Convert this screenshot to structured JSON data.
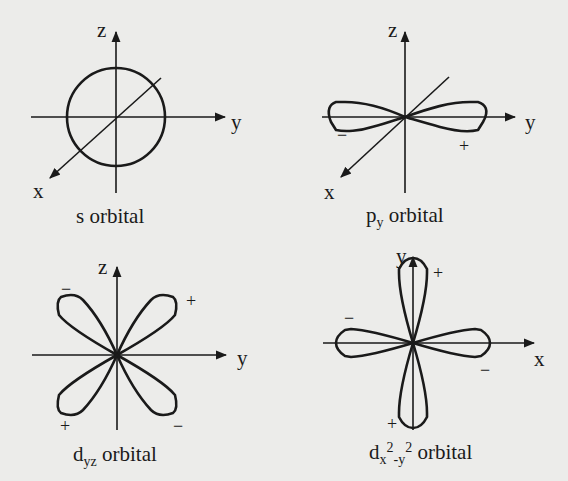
{
  "figure": {
    "background_color": "#ececea",
    "ink_color": "#1a1a1a",
    "panels": [
      {
        "id": "s",
        "caption_main": "s",
        "caption_sub": "",
        "caption_tail": " orbital",
        "axes": {
          "vertical": "z",
          "horizontal": "y",
          "diagonal": "x"
        },
        "shape": "sphere (circle)",
        "signs": []
      },
      {
        "id": "py",
        "caption_main": "p",
        "caption_sub": "y",
        "caption_tail": " orbital",
        "axes": {
          "vertical": "z",
          "horizontal": "y",
          "diagonal": "x"
        },
        "shape": "two lobes along y-axis",
        "signs": [
          {
            "label": "−",
            "position": "left lobe"
          },
          {
            "label": "+",
            "position": "right lobe"
          }
        ]
      },
      {
        "id": "dyz",
        "caption_main": "d",
        "caption_sub": "yz",
        "caption_tail": " orbital",
        "axes": {
          "vertical": "z",
          "horizontal": "y"
        },
        "shape": "four lobes between axes",
        "signs": [
          {
            "label": "−",
            "position": "upper-left"
          },
          {
            "label": "+",
            "position": "upper-right"
          },
          {
            "label": "+",
            "position": "lower-left"
          },
          {
            "label": "−",
            "position": "lower-right"
          }
        ]
      },
      {
        "id": "dx2y2",
        "caption_main": "d",
        "caption_sub1": "x",
        "caption_sup1": "2",
        "caption_sub2": "-y",
        "caption_sup2": "2",
        "caption_tail": " orbital",
        "axes": {
          "vertical": "y",
          "horizontal": "x"
        },
        "shape": "four lobes along axes",
        "signs": [
          {
            "label": "+",
            "position": "top"
          },
          {
            "label": "−",
            "position": "left"
          },
          {
            "label": "−",
            "position": "right"
          },
          {
            "label": "+",
            "position": "bottom"
          }
        ]
      }
    ]
  }
}
